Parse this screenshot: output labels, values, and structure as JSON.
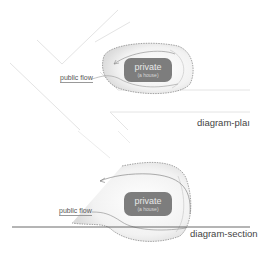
{
  "diagrams": [
    {
      "id": "plan",
      "caption": "diagram-plaı",
      "private_label": "private",
      "private_sublabel": "(a house)",
      "flow_label": "public flow"
    },
    {
      "id": "section",
      "caption": "diagram-section",
      "private_label": "private",
      "private_sublabel": "(a house)",
      "flow_label": "public flow"
    }
  ],
  "colors": {
    "box": "#7d7d7d",
    "line_light": "#e2e2e2",
    "line_dark": "#555555",
    "dashed": "#666666"
  }
}
